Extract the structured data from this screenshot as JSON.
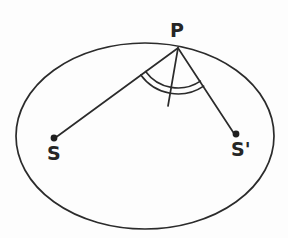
{
  "figure": {
    "background_color": "#fdfdfd",
    "ink_color": "#2b2b2b"
  },
  "labels": {
    "point_p": "P",
    "focus_left": "S",
    "focus_right": "S'"
  },
  "geometry": {
    "ellipse": {
      "center_x": 145,
      "center_y": 136,
      "radius_x": 129,
      "radius_y": 93
    },
    "point_p": {
      "x": 178,
      "y": 48
    },
    "focus_left": {
      "x": 54,
      "y": 138
    },
    "focus_right": {
      "x": 236,
      "y": 134
    },
    "normal_end": {
      "x": 168,
      "y": 106
    },
    "dot_radius": 3.4,
    "arc_inner_radius": 40,
    "arc_outer_radius": 46,
    "stroke_width": 1.6
  },
  "annotations": {
    "angle_marks": "double arc",
    "angle_mark_count": 2
  }
}
